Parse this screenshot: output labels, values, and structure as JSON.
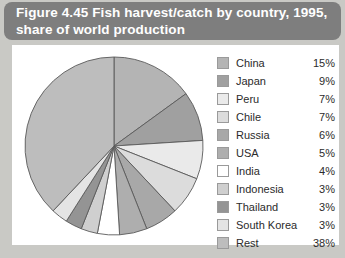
{
  "figure": {
    "title": "Figure 4.45 Fish harvest/catch by country, 1995,\nshare of world production",
    "banner_color": "#7e7e7e",
    "panel_color": "#ffffff",
    "background_color": "#c9c9c5"
  },
  "chart_data": {
    "type": "pie",
    "title": "Figure 4.45 Fish harvest/catch by country, 1995, share of world production",
    "xlabel": "",
    "ylabel": "",
    "unit": "%",
    "start_angle_deg": 0,
    "direction": "clockwise",
    "legend_position": "right",
    "grid": false,
    "categories": [
      "China",
      "Japan",
      "Peru",
      "Chile",
      "Russia",
      "USA",
      "India",
      "Indonesia",
      "Thailand",
      "South Korea",
      "Rest"
    ],
    "values": [
      15,
      9,
      7,
      7,
      6,
      5,
      4,
      3,
      3,
      3,
      38
    ],
    "labels": [
      "15%",
      "9%",
      "7%",
      "7%",
      "6%",
      "5%",
      "4%",
      "3%",
      "3%",
      "3%",
      "38%"
    ],
    "colors": [
      "#b4b4b4",
      "#a0a0a0",
      "#eaeaea",
      "#dcdcdc",
      "#a8a8a8",
      "#aeaeae",
      "#ffffff",
      "#cfcfcf",
      "#949494",
      "#e4e4e4",
      "#bdbdbd"
    ],
    "slice_border_color": "#5a5a5a"
  },
  "legend": {
    "items": [
      {
        "label": "China",
        "value": "15%"
      },
      {
        "label": "Japan",
        "value": "9%"
      },
      {
        "label": "Peru",
        "value": "7%"
      },
      {
        "label": "Chile",
        "value": "7%"
      },
      {
        "label": "Russia",
        "value": "6%"
      },
      {
        "label": "USA",
        "value": "5%"
      },
      {
        "label": "India",
        "value": "4%"
      },
      {
        "label": "Indonesia",
        "value": "3%"
      },
      {
        "label": "Thailand",
        "value": "3%"
      },
      {
        "label": "South Korea",
        "value": "3%"
      },
      {
        "label": "Rest",
        "value": "38%"
      }
    ]
  }
}
